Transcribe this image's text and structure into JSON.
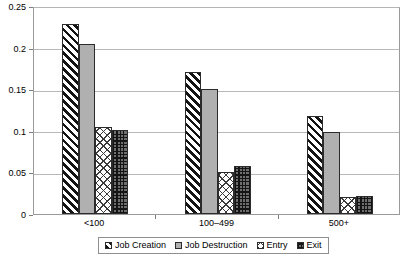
{
  "chart_data": {
    "type": "bar",
    "title": "",
    "xlabel": "",
    "ylabel": "",
    "ylim": [
      0,
      0.25
    ],
    "yticks": [
      "0",
      "0.05",
      "0.1",
      "0.15",
      "0.2",
      "0.25"
    ],
    "ytick_values": [
      0,
      0.05,
      0.1,
      0.15,
      0.2,
      0.25
    ],
    "grid": true,
    "legend_position": "bottom",
    "categories": [
      "<100",
      "100–499",
      "500+"
    ],
    "series": [
      {
        "name": "Job Creation",
        "pattern": "diagonal-stripes",
        "values": [
          0.228,
          0.171,
          0.118
        ]
      },
      {
        "name": "Job Destruction",
        "pattern": "solid-gray",
        "values": [
          0.204,
          0.15,
          0.099
        ]
      },
      {
        "name": "Entry",
        "pattern": "diagonal-crosshatch",
        "values": [
          0.104,
          0.051,
          0.021
        ]
      },
      {
        "name": "Exit",
        "pattern": "grid-crosshatch",
        "values": [
          0.101,
          0.058,
          0.022
        ]
      }
    ]
  },
  "legend": {
    "items": [
      {
        "label": "Job Creation"
      },
      {
        "label": "Job Destruction"
      },
      {
        "label": "Entry"
      },
      {
        "label": "Exit"
      }
    ]
  },
  "colors": {
    "axis": "#9a9a9a",
    "gridline": "#b8b8b8",
    "bar_outline": "#2b2b2b",
    "series_gray": "#b0b0b0",
    "text": "#000000",
    "background": "#ffffff"
  }
}
